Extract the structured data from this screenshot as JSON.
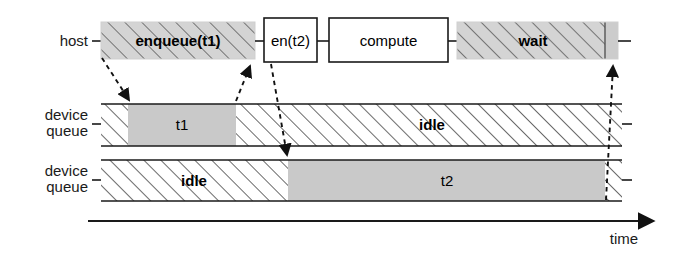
{
  "diagram": {
    "colors": {
      "stroke": "#1a1a1a",
      "hatch_fill": "#ffffff",
      "busy_fill": "#c9c9c9",
      "host_block_fill": "#cccccc",
      "background": "#ffffff"
    },
    "rows": [
      {
        "id": "host",
        "label_line1": "host",
        "label_line2": ""
      },
      {
        "id": "device-queue-1",
        "label_line1": "device",
        "label_line2": "queue"
      },
      {
        "id": "device-queue-2",
        "label_line1": "device",
        "label_line2": "queue"
      }
    ],
    "host_blocks": [
      {
        "id": "enqueue-t1",
        "label": "enqueue(t1)",
        "style": "hatched",
        "bold": true
      },
      {
        "id": "en-t2",
        "label": "en(t2)",
        "style": "plain",
        "bold": false
      },
      {
        "id": "compute",
        "label": "compute",
        "style": "plain",
        "bold": false
      },
      {
        "id": "wait",
        "label": "wait",
        "style": "hatched",
        "bold": true
      }
    ],
    "device_queue_1_blocks": [
      {
        "id": "dq1-idle-head",
        "label": "",
        "style": "hatched"
      },
      {
        "id": "dq1-t1",
        "label": "t1",
        "style": "busy"
      },
      {
        "id": "dq1-idle-tail",
        "label": "idle",
        "style": "hatched"
      }
    ],
    "device_queue_2_blocks": [
      {
        "id": "dq2-idle-head",
        "label": "idle",
        "style": "hatched"
      },
      {
        "id": "dq2-t2",
        "label": "t2",
        "style": "busy"
      },
      {
        "id": "dq2-idle-tail",
        "label": "",
        "style": "hatched"
      }
    ],
    "axis": {
      "label": "time",
      "arrow": "right"
    },
    "arrows": [
      {
        "id": "arrow-enqueue-t1-to-dq1",
        "from": "enqueue(t1) start",
        "to": "device queue 1 t1 start"
      },
      {
        "id": "arrow-dq1-t1-end-to-en-t2",
        "from": "device queue 1 t1 end",
        "to": "en(t2)"
      },
      {
        "id": "arrow-en-t2-to-dq2",
        "from": "en(t2)",
        "to": "device queue 2 t2 start"
      },
      {
        "id": "arrow-dq2-t2-end-to-wait",
        "from": "device queue 2 t2 end",
        "to": "wait end"
      }
    ]
  }
}
